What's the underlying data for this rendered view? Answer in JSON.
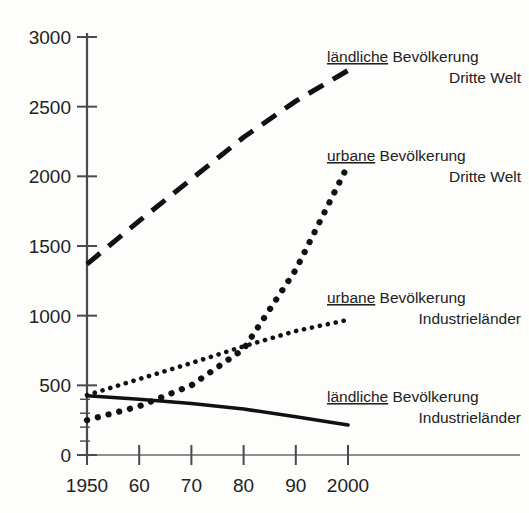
{
  "chart_data": {
    "type": "line",
    "title": "",
    "xlabel": "",
    "ylabel": "",
    "xlim": [
      1950,
      2000
    ],
    "ylim": [
      0,
      3000
    ],
    "grid": false,
    "legend_position": "right-inline",
    "x_ticks": [
      {
        "value": 1950,
        "label": "1950"
      },
      {
        "value": 1960,
        "label": "60"
      },
      {
        "value": 1970,
        "label": "70"
      },
      {
        "value": 1980,
        "label": "80"
      },
      {
        "value": 1990,
        "label": "90"
      },
      {
        "value": 2000,
        "label": "2000"
      }
    ],
    "y_ticks": [
      {
        "value": 0,
        "label": "0"
      },
      {
        "value": 500,
        "label": "500"
      },
      {
        "value": 1000,
        "label": "1000"
      },
      {
        "value": 1500,
        "label": "1500"
      },
      {
        "value": 2000,
        "label": "2000"
      },
      {
        "value": 2500,
        "label": "2500"
      },
      {
        "value": 3000,
        "label": "3000"
      }
    ],
    "x": [
      1950,
      1960,
      1970,
      1980,
      1990,
      2000
    ],
    "series": [
      {
        "name": "laendliche-bevoelkerung-dritte-welt",
        "style": "dashed",
        "label_line1_underlined": "ländliche",
        "label_line1_rest": " Bevölkerung",
        "label_line2": "Dritte Welt",
        "values": [
          1370,
          1680,
          1980,
          2280,
          2540,
          2760
        ]
      },
      {
        "name": "urbane-bevoelkerung-dritte-welt",
        "style": "dotted-bold",
        "label_line1_underlined": "urbane",
        "label_line1_rest": " Bevölkerung",
        "label_line2": "Dritte Welt",
        "values": [
          250,
          350,
          500,
          760,
          1330,
          2080
        ]
      },
      {
        "name": "urbane-bevoelkerung-industrielaender",
        "style": "dotted-fine",
        "label_line1_underlined": "urbane",
        "label_line1_rest": " Bevölkerung",
        "label_line2": "Industrieländer",
        "values": [
          430,
          545,
          660,
          780,
          890,
          970
        ]
      },
      {
        "name": "laendliche-bevoelkerung-industrielaender",
        "style": "solid",
        "label_line1_underlined": "ländliche",
        "label_line1_rest": " Bevölkerung",
        "label_line2": "Industrieländer",
        "values": [
          425,
          400,
          370,
          330,
          275,
          215
        ]
      }
    ],
    "colors": {
      "ink": "#111111",
      "axis": "#4a4a4a",
      "background": "#fdfdfc"
    }
  },
  "axes": {
    "y_axis_name": "y-axis",
    "x_axis_name": "x-axis"
  }
}
